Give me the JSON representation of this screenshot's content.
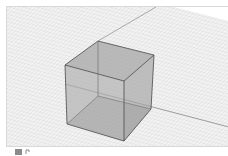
{
  "viewport": {
    "name": "3D modeling viewport",
    "background_color": "#f2f2f2",
    "grid_color": "#dcdcdc",
    "object": {
      "type": "cube",
      "fill_color": "#9a9a9a",
      "edge_color": "#4a4a4a"
    },
    "axes": {
      "color": "#6a6a6a"
    }
  },
  "footer": {
    "icons": [
      "view-icon",
      "camera-icon"
    ]
  }
}
